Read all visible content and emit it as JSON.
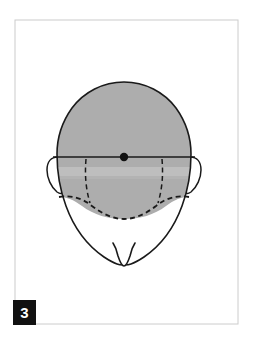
{
  "figure": {
    "name": "anterior-head-diagram",
    "caption_number": "3",
    "background_color": "#ffffff",
    "frame": {
      "name": "figure-border",
      "x": 15,
      "y": 20,
      "width": 223,
      "height": 304,
      "stroke_color": "#cccccc",
      "stroke_width": 1
    },
    "plate_label": {
      "number": "3",
      "box_color": "#111111",
      "text_color": "#ffffff",
      "x": 13,
      "y": 300,
      "width": 23,
      "height": 25
    },
    "shapes": {
      "head_outline": {
        "name": "head-outline",
        "stroke_color": "#1a1a1a",
        "stroke_width": 1.6,
        "fill": "none",
        "description": "Frontal-view head silhouette with rounded cranium and tapering jaw ending in a chin notch",
        "path": "M 124 82 C 103 82 84 92 72 108 C 62 122 57 138 57 154 C 57 172 60 190 66 206 C 74 228 88 246 104 257 C 110 261 114 263 117 264 C 119 265 121 265 124 265 C 127 265 129 265 131 264 C 134 263 138 261 144 257 C 160 246 174 228 182 206 C 188 190 191 172 191 154 C 191 138 186 122 176 108 C 164 92 145 82 124 82 Z"
      },
      "chin_notch": {
        "name": "chin-notch",
        "stroke_color": "#1a1a1a",
        "stroke_width": 1.6,
        "fill": "#ffffff",
        "path": "M 114 244 C 116 247 117 251 118 256 C 120 262 122 265 124 265 C 126 265 128 262 130 256 C 131 251 132 247 134 244 C 130 246 127 246 124 246 C 121 246 118 246 114 244 Z"
      },
      "shaded_cap": {
        "name": "shaded-cranial-region",
        "fill_color": "#adadad",
        "light_band_color": "#c4c4c4",
        "description": "Gray-filled upper cranium bounded above by the skull contour, below by a dashed bowl-shaped curve"
      },
      "horizontal_reference_line": {
        "name": "horizontal-reference-line",
        "stroke_color": "#1a1a1a",
        "stroke_width": 1.5,
        "x1": 53,
        "y1": 157,
        "x2": 195,
        "y2": 157
      },
      "center_point": {
        "name": "center-reference-point",
        "fill_color": "#111111",
        "cx": 124,
        "cy": 157,
        "r": 4.2
      },
      "ear_left": {
        "name": "ear-left",
        "stroke_color": "#1a1a1a",
        "stroke_width": 1.5,
        "fill": "#ffffff",
        "path": "M 58 157 C 51 157 47 162 47 170 C 47 178 51 187 57 192 C 60 194 62 194 63 192 C 62 186 60 178 60 170 C 60 164 60 160 61 157 Z"
      },
      "ear_right": {
        "name": "ear-right",
        "stroke_color": "#1a1a1a",
        "stroke_width": 1.5,
        "fill": "#ffffff",
        "path": "M 190 157 C 197 157 201 162 201 170 C 201 178 197 187 191 192 C 188 194 186 194 185 192 C 186 186 188 178 188 170 C 188 164 188 160 187 157 Z"
      },
      "dashed_bowl_curve": {
        "name": "dashed-occlusal-curve",
        "stroke_color": "#1a1a1a",
        "stroke_width": 1.8,
        "dash_pattern": "5 3.5",
        "fill": "none",
        "path": "M 59 197 C 72 195 82 198 92 206 C 104 215 114 219 124 219 C 134 219 144 215 156 206 C 166 198 176 195 189 197"
      },
      "dashed_left_ramus": {
        "name": "dashed-left-ramus-line",
        "stroke_color": "#1a1a1a",
        "stroke_width": 1.5,
        "dash_pattern": "5 3.5",
        "fill": "none",
        "path": "M 86 159 C 85 172 85 186 90 203"
      },
      "dashed_right_ramus": {
        "name": "dashed-right-ramus-line",
        "stroke_color": "#1a1a1a",
        "stroke_width": 1.5,
        "dash_pattern": "5 3.5",
        "fill": "none",
        "path": "M 162 159 C 163 172 163 186 158 203"
      }
    }
  }
}
